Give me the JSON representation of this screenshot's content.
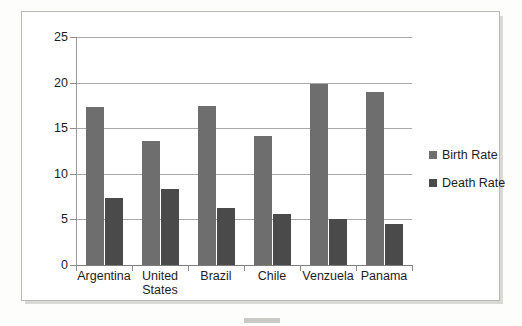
{
  "chart_data": {
    "type": "bar",
    "title": "",
    "xlabel": "",
    "ylabel": "",
    "categories": [
      "Argentina",
      "United States",
      "Brazil",
      "Chile",
      "Venzuela",
      "Panama"
    ],
    "series": [
      {
        "name": "Birth Rate",
        "color": "#6e6e6e",
        "values": [
          17.3,
          13.6,
          17.4,
          14.2,
          19.8,
          19.0
        ]
      },
      {
        "name": "Death Rate",
        "color": "#4a4a4a",
        "values": [
          7.3,
          8.3,
          6.3,
          5.6,
          5.1,
          4.5
        ]
      }
    ],
    "ylim": [
      0,
      25
    ],
    "yticks": [
      0,
      5,
      10,
      15,
      20,
      25
    ],
    "ytick_labels": [
      "0",
      "5",
      "10",
      "15",
      "20",
      "25"
    ],
    "grid": true,
    "legend_position": "right"
  },
  "legend": {
    "items": [
      {
        "label": "Birth Rate",
        "swatch": "birth"
      },
      {
        "label": "Death Rate",
        "swatch": "death"
      }
    ]
  }
}
